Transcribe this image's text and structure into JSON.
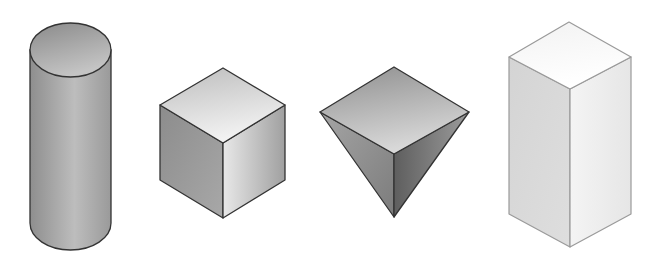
{
  "figure": {
    "type": "geometric-solids-illustration",
    "background": "#ffffff",
    "stroke_color": "#333333",
    "shapes": [
      {
        "id": "cylinder",
        "label": "Cylinder",
        "top_fill": [
          "#8a8a8a",
          "#c4c4c4"
        ],
        "side_fill": [
          "#8e8e8e",
          "#bdbdbd",
          "#9a9a9a"
        ]
      },
      {
        "id": "cube",
        "label": "Cube",
        "top_fill": [
          "#bdbdbd",
          "#f2f2f2"
        ],
        "left_fill": [
          "#8c8c8c",
          "#a8a8a8"
        ],
        "right_fill": [
          "#e8e8e8",
          "#a0a0a0"
        ]
      },
      {
        "id": "pyramid",
        "label": "Inverted pyramid",
        "top_fill": [
          "#8f8f8f",
          "#d8d8d8"
        ],
        "left_fill": [
          "#a5a5a5",
          "#7c7c7c"
        ],
        "right_fill": [
          "#5e5e5e",
          "#9c9c9c"
        ]
      },
      {
        "id": "prism",
        "label": "Rectangular prism",
        "top_fill": [
          "#f2f2f2",
          "#ffffff"
        ],
        "left_fill": [
          "#d4d4d4",
          "#dedede"
        ],
        "right_fill": [
          "#f4f4f4",
          "#e6e6e6"
        ],
        "stroke_color": "#9a9a9a"
      }
    ]
  }
}
